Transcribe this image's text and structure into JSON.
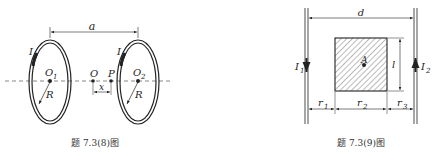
{
  "figure_left": {
    "caption": "题 7.3(8)图",
    "labels": {
      "distance": "a",
      "current_left": "I",
      "current_right": "I",
      "center_left": "O",
      "center_left_sub": "1",
      "center_right": "O",
      "center_right_sub": "2",
      "midpoint": "O",
      "point": "P",
      "offset": "x",
      "radius_left": "R",
      "radius_right": "R"
    }
  },
  "figure_right": {
    "caption": "题 7.3(9)图",
    "labels": {
      "distance": "d",
      "current_left": "I",
      "current_left_sub": "1",
      "current_right": "I",
      "current_right_sub": "2",
      "point": "A",
      "side": "l",
      "r1": "r",
      "r1_sub": "1",
      "r2": "r",
      "r2_sub": "2",
      "r3": "r",
      "r3_sub": "3"
    }
  },
  "colors": {
    "stroke": "#222222",
    "hatch": "#555555",
    "dash": "#555555"
  }
}
